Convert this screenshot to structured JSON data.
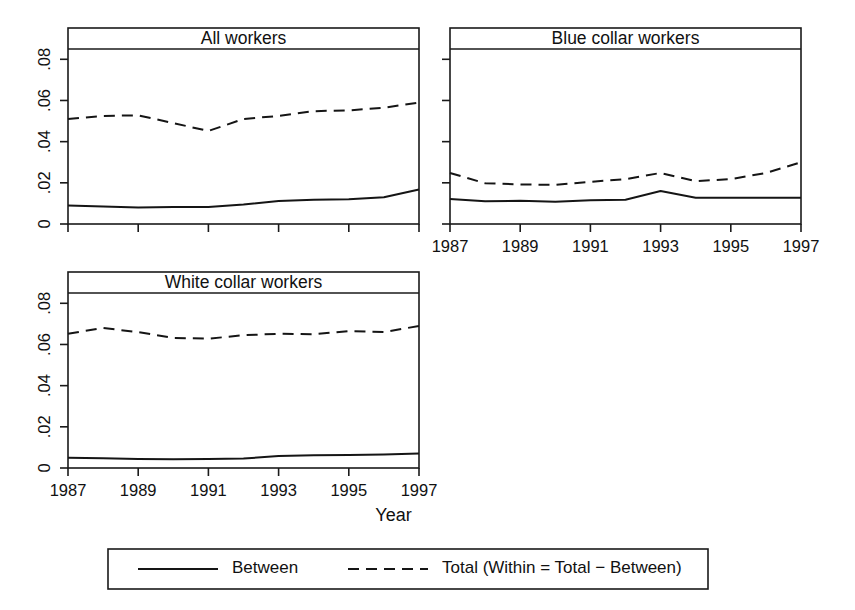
{
  "figure": {
    "background": "#ffffff",
    "ink_color": "#151515",
    "xlabel": "Year",
    "legend": {
      "entries": [
        {
          "label": "Between",
          "style": "solid"
        },
        {
          "label": "Total (Within = Total − Between)",
          "style": "dashed"
        }
      ]
    }
  },
  "chart_data": {
    "type": "line",
    "title": "",
    "xlabel": "Year",
    "ylabel": "",
    "xlim": [
      1987,
      1997
    ],
    "ylim": [
      0,
      0.085
    ],
    "grid": false,
    "legend_position": "bottom",
    "x": [
      1987,
      1988,
      1989,
      1990,
      1991,
      1992,
      1993,
      1994,
      1995,
      1996,
      1997
    ],
    "xticks": [
      1987,
      1989,
      1991,
      1993,
      1995,
      1997
    ],
    "xtick_labels": [
      "1987",
      "1989",
      "1991",
      "1993",
      "1995",
      "1997"
    ],
    "yticks": [
      0,
      0.02,
      0.04,
      0.06,
      0.08
    ],
    "ytick_labels": [
      "0",
      ".02",
      ".04",
      ".06",
      ".08"
    ],
    "panels": [
      {
        "title": "All workers",
        "show_xaxis_labels": false,
        "show_yaxis_labels": true,
        "series": [
          {
            "name": "Between",
            "style": "solid",
            "values": [
              0.009,
              0.0085,
              0.008,
              0.0083,
              0.0082,
              0.0095,
              0.0112,
              0.0118,
              0.012,
              0.013,
              0.0168
            ]
          },
          {
            "name": "Total",
            "style": "dashed",
            "values": [
              0.051,
              0.0525,
              0.0528,
              0.049,
              0.0452,
              0.051,
              0.0525,
              0.0548,
              0.0552,
              0.0565,
              0.059
            ]
          }
        ]
      },
      {
        "title": "Blue collar workers",
        "show_xaxis_labels": true,
        "show_yaxis_labels": false,
        "series": [
          {
            "name": "Between",
            "style": "solid",
            "values": [
              0.0122,
              0.011,
              0.0113,
              0.0108,
              0.0115,
              0.0118,
              0.016,
              0.0128,
              0.0128,
              0.0128,
              0.0128
            ]
          },
          {
            "name": "Total",
            "style": "dashed",
            "values": [
              0.0248,
              0.0198,
              0.0192,
              0.019,
              0.0205,
              0.0218,
              0.0248,
              0.0208,
              0.0218,
              0.0248,
              0.03
            ]
          }
        ]
      },
      {
        "title": "White collar workers",
        "show_xaxis_labels": true,
        "show_yaxis_labels": true,
        "series": [
          {
            "name": "Between",
            "style": "solid",
            "values": [
              0.005,
              0.0047,
              0.0044,
              0.0043,
              0.0044,
              0.0046,
              0.0058,
              0.0062,
              0.0063,
              0.0065,
              0.007
            ]
          },
          {
            "name": "Total",
            "style": "dashed",
            "values": [
              0.0652,
              0.068,
              0.066,
              0.0632,
              0.0628,
              0.0645,
              0.0652,
              0.065,
              0.0665,
              0.066,
              0.069
            ]
          }
        ]
      }
    ]
  }
}
